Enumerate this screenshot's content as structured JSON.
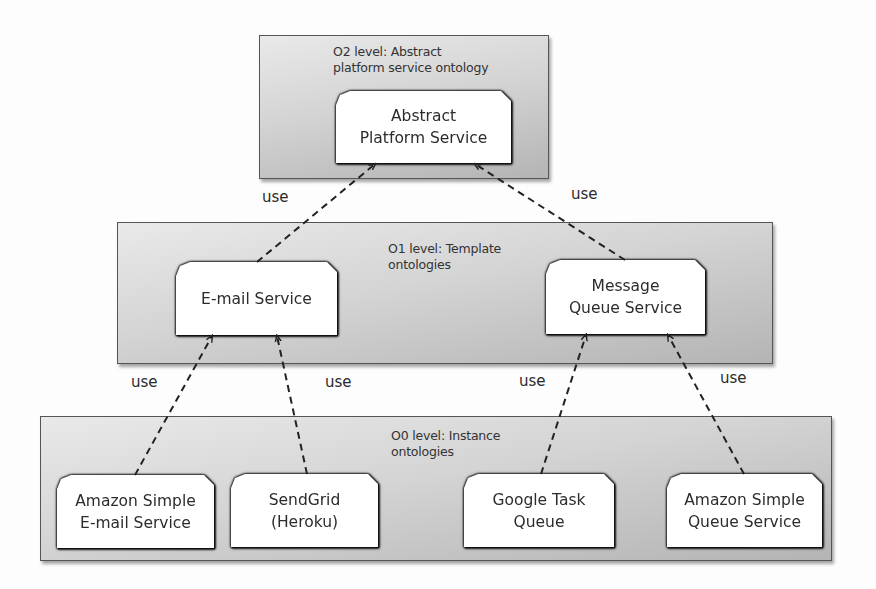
{
  "levels": {
    "o2": {
      "label_line1": "O2 level: Abstract",
      "label_line2": "platform service ontology"
    },
    "o1": {
      "label_line1": "O1 level: Template",
      "label_line2": "ontologies"
    },
    "o0": {
      "label_line1": "O0 level: Instance",
      "label_line2": "ontologies"
    }
  },
  "nodes": {
    "abstract": {
      "line1": "Abstract",
      "line2": "Platform Service"
    },
    "email": {
      "line1": "E-mail Service"
    },
    "mq": {
      "line1": "Message",
      "line2": "Queue Service"
    },
    "ses": {
      "line1": "Amazon Simple",
      "line2": "E-mail Service"
    },
    "sendgrid": {
      "line1": "SendGrid",
      "line2": "(Heroku)"
    },
    "gtq": {
      "line1": "Google Task",
      "line2": "Queue"
    },
    "sqs": {
      "line1": "Amazon Simple",
      "line2": "Queue Service"
    }
  },
  "edges": [
    {
      "from": "E-mail Service",
      "to": "Abstract Platform Service",
      "label": "use"
    },
    {
      "from": "Message Queue Service",
      "to": "Abstract Platform Service",
      "label": "use"
    },
    {
      "from": "Amazon Simple E-mail Service",
      "to": "E-mail Service",
      "label": "use"
    },
    {
      "from": "SendGrid (Heroku)",
      "to": "E-mail Service",
      "label": "use"
    },
    {
      "from": "Google Task Queue",
      "to": "Message Queue Service",
      "label": "use"
    },
    {
      "from": "Amazon Simple Queue Service",
      "to": "Message Queue Service",
      "label": "use"
    }
  ],
  "colors": {
    "edge": "#222222",
    "node_fill": "#ffffff",
    "level_fill_dark": "#b4b4b4",
    "level_fill_light": "#e9e9e9"
  }
}
